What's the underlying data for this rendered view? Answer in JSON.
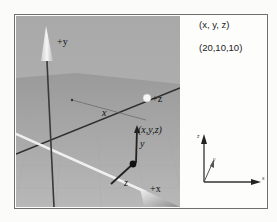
{
  "figure": {
    "scene3d": {
      "axis_labels": {
        "pos_y": "+y",
        "pos_z": "+z",
        "pos_x": "+x"
      },
      "point_label": "(x,y,z)",
      "component_labels": {
        "x": "x",
        "y": "y",
        "z": "z"
      }
    },
    "info_panel": {
      "coord_label": "(x, y, z)",
      "coord_value": "(20,10,10)",
      "mini_axes": {
        "z": "z",
        "y": "y",
        "x": "x"
      }
    }
  }
}
